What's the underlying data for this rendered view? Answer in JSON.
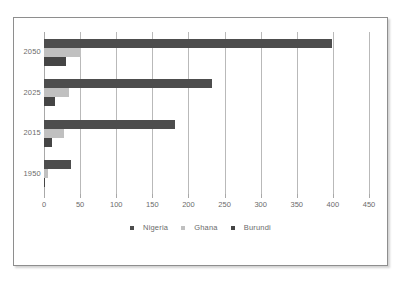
{
  "chart_data": {
    "type": "bar",
    "orientation": "horizontal",
    "title": "",
    "subtitle": "",
    "xlabel": "",
    "ylabel": "",
    "categories": [
      "2050",
      "2025",
      "2015",
      "1950"
    ],
    "series": [
      {
        "name": "Nigeria",
        "color": "#4d4d4d",
        "values": [
          399,
          233,
          182,
          38
        ]
      },
      {
        "name": "Ghana",
        "color": "#c0c0c0",
        "values": [
          51,
          34,
          28,
          5
        ]
      },
      {
        "name": "Burundi",
        "color": "#454545",
        "values": [
          30,
          15,
          11,
          2
        ]
      }
    ],
    "xlim": [
      0,
      450
    ],
    "xticks": [
      0,
      50,
      100,
      150,
      200,
      250,
      300,
      350,
      400,
      450
    ],
    "xtick_labels": [
      "0",
      "50",
      "100",
      "150",
      "200",
      "250",
      "300",
      "350",
      "400",
      "450"
    ],
    "grid": true,
    "grid_axis": "x",
    "legend": true,
    "legend_position": "bottom",
    "legend_entries": [
      "Nigeria",
      "Ghana",
      "Burundi"
    ],
    "border_color": "#8e8e8e",
    "background": "#ffffff"
  }
}
